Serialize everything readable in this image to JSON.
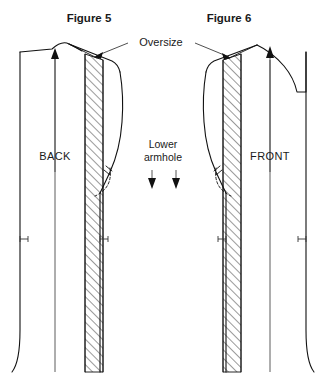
{
  "document": {
    "kind": "sewing-pattern-diagram",
    "background_color": "#ffffff",
    "ink_color": "#111111",
    "width": 326,
    "height": 382
  },
  "figures": [
    {
      "id": "figure-5",
      "title": "Figure 5",
      "title_x": 89,
      "title_y": 22,
      "piece_label": "BACK",
      "piece_label_x": 55,
      "piece_label_y": 160
    },
    {
      "id": "figure-6",
      "title": "Figure 6",
      "title_x": 229,
      "title_y": 22,
      "piece_label": "FRONT",
      "piece_label_x": 270,
      "piece_label_y": 160
    }
  ],
  "callouts": {
    "oversize": {
      "text": "Oversize",
      "x": 161,
      "y": 45
    },
    "lower_armhole": {
      "line1": "Lower",
      "line2": "armhole",
      "x": 163,
      "line1_y": 148,
      "line2_y": 161
    }
  },
  "legend": {
    "hatched_meaning": "Oversize added width",
    "dashed_meaning": "Original armhole",
    "solid_meaning": "Adjusted pattern outline"
  },
  "colors": {
    "ink": "#111111",
    "grainline": "#4a4a4a",
    "hatch": "#111111",
    "background": "#ffffff"
  }
}
